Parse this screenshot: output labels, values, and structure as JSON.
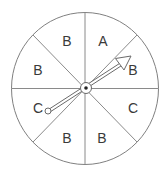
{
  "spinner": {
    "sections": [
      {
        "label": "A",
        "x": 103,
        "y": 46
      },
      {
        "label": "B",
        "x": 133,
        "y": 75
      },
      {
        "label": "C",
        "x": 133,
        "y": 113
      },
      {
        "label": "B",
        "x": 102,
        "y": 143
      },
      {
        "label": "B",
        "x": 67,
        "y": 143
      },
      {
        "label": "C",
        "x": 37,
        "y": 113
      },
      {
        "label": "B",
        "x": 37,
        "y": 75
      },
      {
        "label": "B",
        "x": 67,
        "y": 46
      }
    ],
    "pointing_to": "B",
    "colors": {
      "stroke": "#7a7a7a",
      "text": "#3a3a3a",
      "background": "#ffffff"
    }
  }
}
